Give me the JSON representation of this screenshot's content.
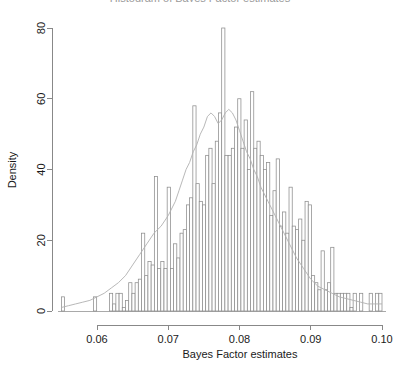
{
  "chart_data": {
    "type": "bar",
    "title": "Histogram of Bayes Factor estimates",
    "xlabel": "Bayes Factor estimates",
    "ylabel": "Density",
    "xlim": [
      0.0545,
      0.1005
    ],
    "ylim": [
      0,
      82
    ],
    "xticks": [
      "0.06",
      "0.07",
      "0.08",
      "0.09",
      "0.10"
    ],
    "xtick_values": [
      0.06,
      0.07,
      0.08,
      0.09,
      0.1
    ],
    "yticks": [
      "0",
      "20",
      "40",
      "60",
      "80"
    ],
    "ytick_values": [
      0,
      20,
      40,
      60,
      80
    ],
    "grid": false,
    "legend": "none",
    "bin_width": 0.00045,
    "bin_starts": [
      0.055,
      0.05545,
      0.0559,
      0.05635,
      0.0568,
      0.05725,
      0.0577,
      0.05815,
      0.0586,
      0.05905,
      0.0595,
      0.05995,
      0.0604,
      0.06085,
      0.0613,
      0.06175,
      0.0622,
      0.06265,
      0.0631,
      0.06355,
      0.064,
      0.06445,
      0.0649,
      0.06535,
      0.0658,
      0.06625,
      0.0667,
      0.06715,
      0.0676,
      0.06805,
      0.0685,
      0.06895,
      0.0694,
      0.06985,
      0.0703,
      0.07075,
      0.0712,
      0.07165,
      0.0721,
      0.07255,
      0.073,
      0.07345,
      0.0739,
      0.07435,
      0.0748,
      0.07525,
      0.0757,
      0.07615,
      0.0766,
      0.07705,
      0.0775,
      0.07795,
      0.0784,
      0.07885,
      0.0793,
      0.07975,
      0.0802,
      0.08065,
      0.0811,
      0.08155,
      0.082,
      0.08245,
      0.0829,
      0.08335,
      0.0838,
      0.08425,
      0.0847,
      0.08515,
      0.0856,
      0.08605,
      0.0865,
      0.08695,
      0.0874,
      0.08785,
      0.0883,
      0.08875,
      0.0892,
      0.08965,
      0.0901,
      0.09055,
      0.091,
      0.09145,
      0.0919,
      0.09235,
      0.0928,
      0.09325,
      0.0937,
      0.09415,
      0.0946,
      0.09505,
      0.0955,
      0.09595,
      0.0964,
      0.09685,
      0.0973,
      0.09775,
      0.0982,
      0.09865,
      0.0991,
      0.09955
    ],
    "values": [
      4,
      0,
      0,
      0,
      0,
      0,
      0,
      0,
      0,
      0,
      4,
      0,
      0,
      0,
      0,
      5,
      2,
      5,
      5,
      1,
      3,
      8,
      5,
      8,
      9,
      22,
      10,
      14,
      13,
      38,
      12,
      14,
      12,
      35,
      12,
      19,
      15,
      22,
      23,
      30,
      32,
      58,
      36,
      31,
      30,
      44,
      46,
      36,
      48,
      56,
      80,
      44,
      44,
      46,
      52,
      60,
      46,
      54,
      40,
      62,
      46,
      48,
      44,
      40,
      42,
      27,
      34,
      43,
      24,
      28,
      22,
      35,
      24,
      23,
      26,
      20,
      31,
      30,
      10,
      8,
      6,
      17,
      6,
      8,
      18,
      5,
      5,
      5,
      5,
      5,
      1,
      5,
      0,
      5,
      0,
      0,
      5,
      0,
      5,
      5
    ],
    "density_curve": {
      "x": [
        0.055,
        0.056,
        0.057,
        0.058,
        0.059,
        0.06,
        0.061,
        0.062,
        0.063,
        0.064,
        0.065,
        0.066,
        0.067,
        0.068,
        0.069,
        0.07,
        0.071,
        0.0715,
        0.072,
        0.0725,
        0.073,
        0.0735,
        0.074,
        0.0745,
        0.075,
        0.0755,
        0.076,
        0.0765,
        0.077,
        0.0775,
        0.078,
        0.0785,
        0.079,
        0.0795,
        0.08,
        0.0805,
        0.081,
        0.0815,
        0.082,
        0.0825,
        0.083,
        0.084,
        0.085,
        0.086,
        0.087,
        0.088,
        0.089,
        0.09,
        0.091,
        0.092,
        0.093,
        0.094,
        0.095,
        0.096,
        0.097,
        0.098,
        0.099,
        0.1
      ],
      "y": [
        1,
        1.5,
        2,
        2.5,
        3,
        4,
        5,
        6.5,
        8,
        10,
        13,
        16,
        19,
        22,
        24,
        27,
        31,
        34,
        37,
        40,
        42,
        45,
        47,
        50,
        52,
        55,
        56,
        55,
        53,
        54,
        56,
        57,
        56,
        54,
        51,
        48,
        45,
        43,
        40,
        38,
        35,
        31,
        27,
        23,
        19,
        15,
        12,
        9,
        7,
        6,
        5,
        4,
        3.5,
        3,
        2.5,
        2,
        2,
        2
      ]
    }
  },
  "axis": {
    "y_label": "Density",
    "x_label": "Bayes Factor estimates"
  }
}
